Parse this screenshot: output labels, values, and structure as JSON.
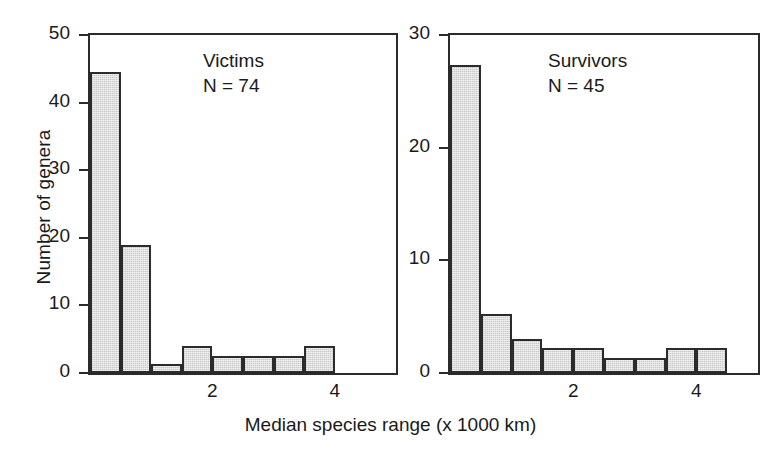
{
  "figure": {
    "xlabel": "Median species range (x 1000 km)",
    "ylabel": "Number of genera"
  },
  "panels": [
    {
      "id": "victims",
      "annotation_title": "Victims",
      "annotation_n": "N = 74",
      "yticks": [
        "0",
        "10",
        "20",
        "30",
        "40",
        "50"
      ],
      "xticks": [
        "2",
        "4"
      ]
    },
    {
      "id": "survivors",
      "annotation_title": "Survivors",
      "annotation_n": "N = 45",
      "yticks": [
        "0",
        "10",
        "20",
        "30"
      ],
      "xticks": [
        "2",
        "4"
      ]
    }
  ],
  "chart_data": [
    {
      "type": "bar",
      "title": "Victims",
      "subtitle": "N = 74",
      "xlabel": "Median species range (x 1000 km)",
      "ylabel": "Number of genera",
      "ylim": [
        0,
        50
      ],
      "xlim": [
        0,
        5
      ],
      "yticks": [
        0,
        10,
        20,
        30,
        40,
        50
      ],
      "xticks": [
        2,
        4
      ],
      "grid": false,
      "legend": "none",
      "bin_width": 0.5,
      "bin_edges": [
        0,
        0.5,
        1.0,
        1.5,
        2.0,
        2.5,
        3.0,
        3.5,
        4.0,
        4.5,
        5.0
      ],
      "categories": [
        "0-0.5",
        "0.5-1.0",
        "1.0-1.5",
        "1.5-2.0",
        "2.0-2.5",
        "2.5-3.0",
        "3.0-3.5",
        "3.5-4.0",
        "4.0-4.5",
        "4.5-5.0"
      ],
      "values": [
        44.5,
        19,
        1.3,
        4,
        2.5,
        2.5,
        2.5,
        4,
        0,
        0
      ]
    },
    {
      "type": "bar",
      "title": "Survivors",
      "subtitle": "N = 45",
      "xlabel": "Median species range (x 1000 km)",
      "ylabel": "Number of genera",
      "ylim": [
        0,
        30
      ],
      "xlim": [
        0,
        5
      ],
      "yticks": [
        0,
        10,
        20,
        30
      ],
      "xticks": [
        2,
        4
      ],
      "grid": false,
      "legend": "none",
      "bin_width": 0.5,
      "bin_edges": [
        0,
        0.5,
        1.0,
        1.5,
        2.0,
        2.5,
        3.0,
        3.5,
        4.0,
        4.5,
        5.0
      ],
      "categories": [
        "0-0.5",
        "0.5-1.0",
        "1.0-1.5",
        "1.5-2.0",
        "2.0-2.5",
        "2.5-3.0",
        "3.0-3.5",
        "3.5-4.0",
        "4.0-4.5",
        "4.5-5.0"
      ],
      "values": [
        27.3,
        5.2,
        3.0,
        2.2,
        2.2,
        1.3,
        1.3,
        2.2,
        2.2,
        0
      ]
    }
  ]
}
